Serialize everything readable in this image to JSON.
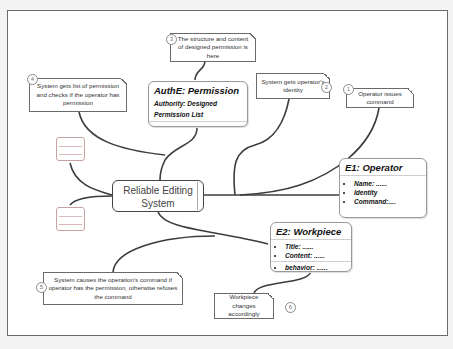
{
  "diagram": {
    "central_node": {
      "label": "Reliable Editing System"
    },
    "entities": [
      {
        "id": "authe",
        "title": "AuthE: Permission",
        "lines": [
          "Authority: Designed",
          "Permission List"
        ]
      },
      {
        "id": "e1",
        "title": "E1: Operator",
        "items": [
          "Name: ......",
          "Identity",
          "Command:...."
        ]
      },
      {
        "id": "e2",
        "title": "E2: Workpiece",
        "items": [
          "Title: ......",
          "Content: ......",
          "behavior: ......"
        ]
      }
    ],
    "steps": [
      {
        "number": "1",
        "text": "Operator issues command"
      },
      {
        "number": "2",
        "text": "System gets operator's identity"
      },
      {
        "number": "3",
        "text": "The structure and content of designed permission is here"
      },
      {
        "number": "4",
        "text": "System gets list of permission and checks if the operator has permission"
      },
      {
        "number": "5",
        "text": "System causes the operation's command if operator has the permission, otherwise refuses the command"
      },
      {
        "number": "6",
        "text": "Workpiece changes accordingly"
      }
    ],
    "colors": {
      "line": "#3c3c3c",
      "border": "#6b6b6b",
      "stub_border": "#c6a3a3"
    }
  }
}
